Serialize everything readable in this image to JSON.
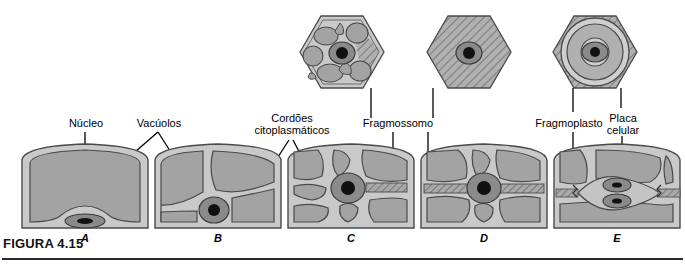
{
  "figure": {
    "caption": "FIGURA 4.15",
    "language": "pt-BR"
  },
  "colors": {
    "cell_wall": "#c9c9c9",
    "cytoplasm": "#b4b4b4",
    "vacuole": "#a3a3a3",
    "nucleus_ring": "#8a8a8a",
    "nucleolus": "#111111",
    "outline": "#4a4a4a",
    "hatch": "#6f6f6f",
    "leader_line": "#000000",
    "rule": "#2b2b2b",
    "background": "#ffffff"
  },
  "labels": [
    {
      "id": "nucleo",
      "text": "Núcleo",
      "lines": [
        "Núcleo"
      ]
    },
    {
      "id": "vacuolos",
      "text": "Vacúolos",
      "lines": [
        "Vacúolos"
      ]
    },
    {
      "id": "cordoes",
      "text": "Cordões citoplasmáticos",
      "lines": [
        "Cordões",
        "citoplasmáticos"
      ]
    },
    {
      "id": "fragmossomo",
      "text": "Fragmossomo",
      "lines": [
        "Fragmossomo"
      ]
    },
    {
      "id": "fragmoplasto",
      "text": "Fragmoplasto",
      "lines": [
        "Fragmoplasto"
      ]
    },
    {
      "id": "placa_celular",
      "text": "Placa celular",
      "lines": [
        "Placa",
        "celular"
      ]
    }
  ],
  "stages": [
    {
      "letter": "A",
      "description": "Célula com vacúolo central grande e núcleo na base",
      "has_top_view": false,
      "features": [
        "vacúolo central",
        "núcleo basal"
      ]
    },
    {
      "letter": "B",
      "description": "Vacúolos separados por cordões citoplasmáticos, núcleo deslocado",
      "has_top_view": false,
      "features": [
        "vacúolos múltiplos",
        "cordões citoplasmáticos",
        "núcleo"
      ]
    },
    {
      "letter": "C",
      "description": "Núcleo migrando para o centro com cordões radiais e fragmossomo incipiente",
      "has_top_view": true,
      "features": [
        "núcleo central",
        "cordões radiais",
        "fragmossomo"
      ]
    },
    {
      "letter": "D",
      "description": "Fragmossomo completo atravessando a célula no plano de divisão",
      "has_top_view": true,
      "features": [
        "fragmossomo completo",
        "núcleo central"
      ]
    },
    {
      "letter": "E",
      "description": "Fragmoplasto e placa celular formando a nova parede entre núcleos-filhos",
      "has_top_view": true,
      "features": [
        "fragmoplasto",
        "placa celular",
        "dois núcleos-filhos"
      ]
    }
  ],
  "top_views": [
    {
      "for_stage": "C",
      "shape": "hexagon",
      "description": "Vista superior com vacúolos e faixa hachurada do fragmossomo"
    },
    {
      "for_stage": "D",
      "shape": "hexagon",
      "description": "Vista superior totalmente hachurada com núcleo central"
    },
    {
      "for_stage": "E",
      "shape": "hexagon",
      "description": "Vista superior com anéis concêntricos do fragmoplasto e placa celular"
    }
  ]
}
